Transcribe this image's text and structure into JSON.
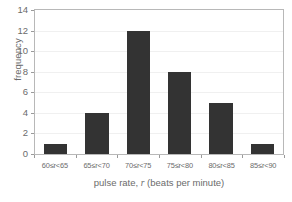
{
  "chart_data": {
    "type": "bar",
    "title": "",
    "subtitle": "",
    "xlabel": "pulse rate, r (beats per minute)",
    "xlabel_text_before_var": "pulse rate, ",
    "xlabel_var": "r",
    "xlabel_text_after_var": " (beats per minute)",
    "ylabel": "frequency",
    "categories": [
      "60≤r<65",
      "65≤r<70",
      "70≤r<75",
      "75≤r<80",
      "80≤r<85",
      "85≤r<90"
    ],
    "values": [
      1,
      4,
      12,
      8,
      5,
      1
    ],
    "ylim": [
      0,
      14
    ],
    "ytick_step": 2,
    "ytick_labels": [
      "0",
      "2",
      "4",
      "6",
      "8",
      "10",
      "12",
      "14"
    ],
    "ytick_values": [
      0,
      2,
      4,
      6,
      8,
      10,
      12,
      14
    ],
    "grid": true,
    "grid_axis": "y",
    "legend": false,
    "legend_position": "none",
    "bar_color": "#333333",
    "grid_color": "#f0f0f0",
    "axis_color": "#b8b8b8",
    "tick_color": "#9a9a9a",
    "text_color": "#6b6b6b",
    "background_color": "#ffffff",
    "annotations": []
  }
}
